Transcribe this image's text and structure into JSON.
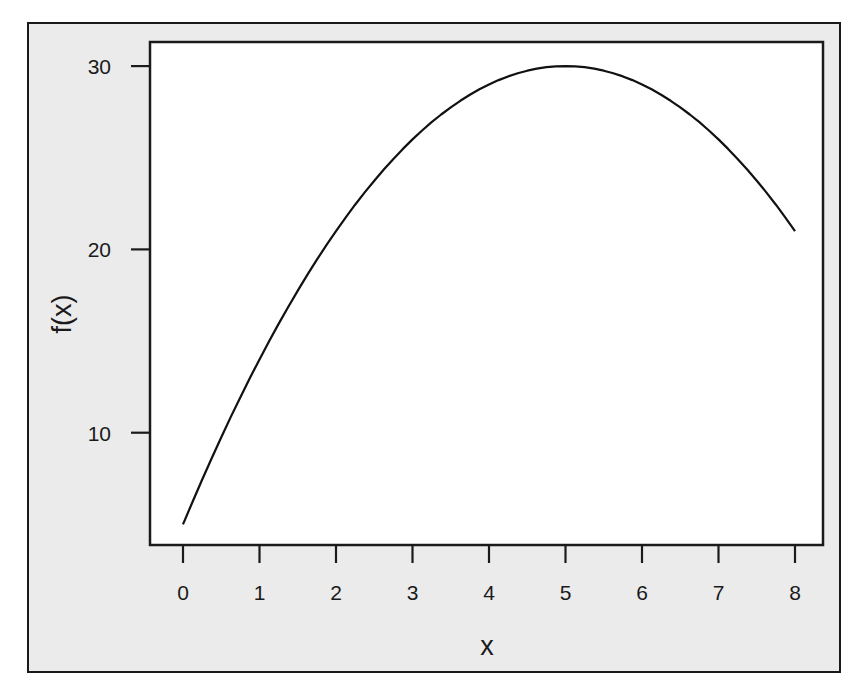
{
  "chart_data": {
    "type": "line",
    "title": "",
    "xlabel": "x",
    "ylabel": "f(x)",
    "xlim": [
      -0.03,
      8.46
    ],
    "ylim": [
      3.8,
      31.4
    ],
    "x_ticks": [
      0,
      1,
      2,
      3,
      4,
      5,
      6,
      7,
      8
    ],
    "y_ticks": [
      10,
      20,
      30
    ],
    "x_tick_labels": [
      "0",
      "1",
      "2",
      "3",
      "4",
      "5",
      "6",
      "7",
      "8"
    ],
    "y_tick_labels": [
      "10",
      "20",
      "30"
    ],
    "grid": false,
    "legend": null,
    "series": [
      {
        "name": "f(x)",
        "x": [
          0,
          0.5,
          1,
          1.5,
          2,
          2.5,
          3,
          3.5,
          4,
          4.5,
          5,
          5.5,
          6,
          6.5,
          7,
          7.5,
          8
        ],
        "values": [
          5,
          9.75,
          14,
          17.75,
          21,
          23.75,
          26,
          27.75,
          29,
          29.75,
          30,
          29.75,
          29,
          27.75,
          26,
          23.75,
          21
        ]
      }
    ],
    "colors": {
      "line": "#111111",
      "frame_background": "#ebebeb",
      "plot_background": "#ffffff",
      "axis": "#1a1a1a"
    }
  }
}
